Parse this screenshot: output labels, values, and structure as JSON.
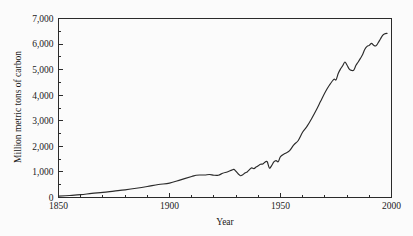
{
  "figure": {
    "background_color": "#fbfbfb",
    "line_color": "#2b2b2b",
    "axis_color": "#2b2b2b"
  },
  "chart_data": {
    "type": "line",
    "title": "",
    "subtitle": "",
    "xlabel": "Year",
    "ylabel": "Million metric tons of carbon",
    "xlim": [
      1850,
      2000
    ],
    "ylim": [
      0,
      7000
    ],
    "grid": false,
    "legend": null,
    "legend_position": "none",
    "x_ticks_major": [
      1850,
      1900,
      1950,
      2000
    ],
    "x_tick_labels": [
      "1850",
      "1900",
      "1950",
      "2000"
    ],
    "x_ticks_minor_step": 10,
    "y_ticks_major": [
      0,
      1000,
      2000,
      3000,
      4000,
      5000,
      6000,
      7000
    ],
    "y_tick_labels": [
      "0",
      "1,000",
      "2,000",
      "3,000",
      "4,000",
      "5,000",
      "6,000",
      "7,000"
    ],
    "y_ticks_minor_step": 500,
    "series": [
      {
        "name": "Global carbon emissions from fossil fuels",
        "x": [
          1850,
          1855,
          1860,
          1865,
          1870,
          1875,
          1880,
          1885,
          1890,
          1895,
          1900,
          1905,
          1910,
          1912,
          1914,
          1916,
          1918,
          1920,
          1922,
          1924,
          1926,
          1928,
          1929,
          1930,
          1931,
          1932,
          1933,
          1934,
          1935,
          1936,
          1937,
          1938,
          1939,
          1940,
          1941,
          1942,
          1943,
          1944,
          1945,
          1946,
          1947,
          1948,
          1949,
          1950,
          1952,
          1954,
          1956,
          1958,
          1960,
          1962,
          1964,
          1966,
          1968,
          1970,
          1972,
          1974,
          1975,
          1976,
          1977,
          1978,
          1979,
          1980,
          1981,
          1982,
          1983,
          1984,
          1985,
          1986,
          1987,
          1988,
          1989,
          1990,
          1991,
          1992,
          1993,
          1994,
          1995,
          1996,
          1997,
          1998
        ],
        "values": [
          55,
          80,
          110,
          160,
          200,
          250,
          300,
          360,
          430,
          510,
          560,
          690,
          820,
          870,
          880,
          880,
          900,
          870,
          870,
          950,
          1000,
          1070,
          1100,
          1020,
          920,
          850,
          890,
          960,
          1000,
          1090,
          1160,
          1130,
          1190,
          1240,
          1300,
          1310,
          1380,
          1400,
          1150,
          1250,
          1390,
          1440,
          1400,
          1600,
          1720,
          1820,
          2060,
          2230,
          2560,
          2790,
          3080,
          3400,
          3750,
          4100,
          4390,
          4620,
          4600,
          4850,
          5020,
          5150,
          5300,
          5170,
          5020,
          4970,
          4980,
          5170,
          5300,
          5440,
          5590,
          5800,
          5910,
          5950,
          6030,
          5950,
          5930,
          6050,
          6200,
          6340,
          6400,
          6420
        ],
        "units": "million metric tons of carbon",
        "start_value": 55,
        "end_value": 6420,
        "peak_value": 6420,
        "peak_year": 1998
      }
    ],
    "annotations": []
  }
}
